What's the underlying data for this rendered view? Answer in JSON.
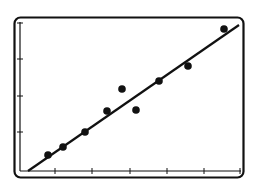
{
  "chart_data": {
    "type": "scatter",
    "title": "",
    "xlabel": "",
    "ylabel": "",
    "x_ticks": 6,
    "y_ticks": 4,
    "grid": false,
    "legend": null,
    "points": [
      {
        "x": 1.0,
        "y": 0.6
      },
      {
        "x": 1.4,
        "y": 0.85
      },
      {
        "x": 2.0,
        "y": 1.3
      },
      {
        "x": 2.6,
        "y": 1.9
      },
      {
        "x": 3.0,
        "y": 2.55
      },
      {
        "x": 3.4,
        "y": 1.9
      },
      {
        "x": 4.0,
        "y": 2.8
      },
      {
        "x": 4.8,
        "y": 3.2
      },
      {
        "x": 5.8,
        "y": 4.2
      }
    ],
    "trendline": {
      "x0": 0.2,
      "y0": 0.15,
      "x1": 6.2,
      "y1": 4.05
    },
    "xlim": [
      0,
      6.4
    ],
    "ylim": [
      0,
      4.4
    ]
  },
  "colors": {
    "ink": "#111111",
    "background": "#ffffff"
  }
}
